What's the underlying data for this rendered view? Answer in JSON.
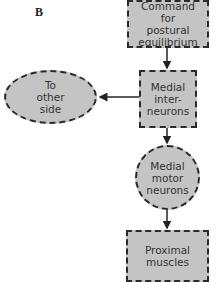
{
  "panel_label": "B",
  "nodes": {
    "command": {
      "text": "Command\nfor\npostural\nequilibrium",
      "shape": "rectangle"
    },
    "medial_interneurons": {
      "text": "Medial\ninter-\nneurons",
      "shape": "rectangle"
    },
    "other_side": {
      "text": "To\nother\nside",
      "shape": "ellipse"
    },
    "medial_motor_neurons": {
      "text": "Medial\nmotor\nneurons",
      "shape": "circle"
    },
    "proximal_muscles": {
      "text": "Proximal\nmuscles",
      "shape": "rectangle"
    }
  },
  "edges": [
    {
      "from": "Command for postural equilibrium",
      "to": "Medial interneurons"
    },
    {
      "from": "Medial interneurons",
      "to": "To other side"
    },
    {
      "from": "Medial interneurons",
      "to": "Medial motor neurons"
    },
    {
      "from": "Medial motor neurons",
      "to": "Proximal muscles"
    }
  ],
  "colors": {
    "node_fill": "#c4c4c4",
    "border": "#2a2a2a",
    "text": "#333333"
  }
}
